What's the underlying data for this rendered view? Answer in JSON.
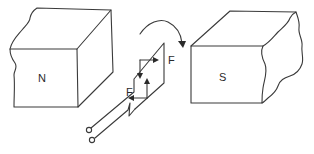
{
  "diagram": {
    "type": "dc-motor-principle",
    "north_magnet": {
      "label": "N"
    },
    "south_magnet": {
      "label": "S"
    },
    "coil": {
      "force_labels": [
        "F",
        "F"
      ]
    },
    "rotation_arrow": {
      "direction": "clockwise"
    },
    "terminals": {
      "count": 2
    }
  },
  "colors": {
    "stroke": "#3a3a3a",
    "background": "#ffffff"
  }
}
